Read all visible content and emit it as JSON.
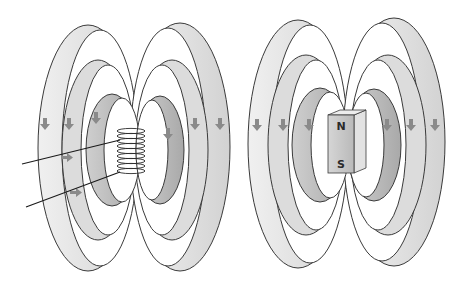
{
  "figure": {
    "panels": [
      {
        "id": "solenoid",
        "description": "Current-carrying coil with magnetic field loops",
        "arrow_direction": "down",
        "has_lead_wires": true
      },
      {
        "id": "bar-magnet",
        "description": "Bar magnet with magnetic field loops",
        "arrow_direction": "down",
        "north_label": "N",
        "south_label": "S"
      }
    ],
    "colors": {
      "ring_light": "#e6e6e6",
      "ring_mid": "#cfcfcf",
      "ring_dark": "#b4b4b4",
      "outline": "#3a3a3a",
      "arrow": "#8a8a8a",
      "magnet_face": "#c8c8c8",
      "magnet_side": "#dedede",
      "background": "#ffffff"
    }
  }
}
